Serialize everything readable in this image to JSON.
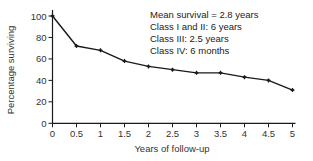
{
  "chart_data": {
    "type": "line",
    "title": "",
    "xlabel": "Years of follow-up",
    "ylabel": "Percentage surviving",
    "x": [
      0,
      0.5,
      1,
      1.5,
      2,
      2.5,
      3,
      3.5,
      4,
      4.5,
      5
    ],
    "series": [
      {
        "name": "Survival",
        "values": [
          100,
          72,
          68,
          58,
          53,
          50,
          47,
          47,
          43,
          40,
          31
        ]
      }
    ],
    "xlim": [
      0,
      5
    ],
    "ylim": [
      0,
      100
    ],
    "xticks": [
      "0",
      "0.5",
      "1",
      "1.5",
      "2",
      "2.5",
      "3",
      "3.5",
      "4",
      "4.5",
      "5"
    ],
    "yticks": [
      "0",
      "20",
      "40",
      "60",
      "80",
      "100"
    ],
    "grid": false,
    "annotations": [
      "Mean survival = 2.8 years",
      "Class I and II: 6 years",
      "Class III: 2.5 years",
      "Class IV: 6 months"
    ],
    "colors": {
      "line": "#1a1a1a",
      "axis": "#1a1a1a"
    }
  }
}
